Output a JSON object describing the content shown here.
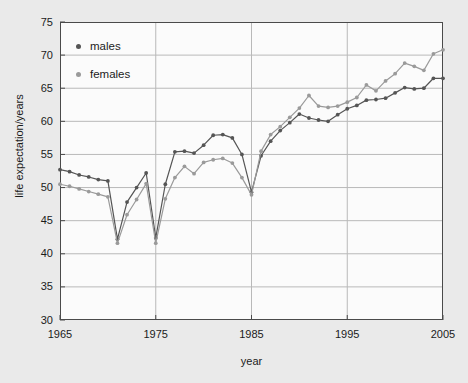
{
  "chart_data": {
    "type": "line",
    "title": "",
    "xlabel": "year",
    "ylabel": "life expectation/years",
    "xlim": [
      1965,
      2005
    ],
    "ylim": [
      30,
      75
    ],
    "xticks": [
      1965,
      1975,
      1985,
      1995,
      2005
    ],
    "yticks": [
      30,
      35,
      40,
      45,
      50,
      55,
      60,
      65,
      70,
      75
    ],
    "grid": true,
    "legend_position": "upper-left-inside",
    "x": [
      1965,
      1966,
      1967,
      1968,
      1969,
      1970,
      1971,
      1972,
      1973,
      1974,
      1975,
      1976,
      1977,
      1978,
      1979,
      1980,
      1981,
      1982,
      1983,
      1984,
      1985,
      1986,
      1987,
      1988,
      1989,
      1990,
      1991,
      1992,
      1993,
      1994,
      1995,
      1996,
      1997,
      1998,
      1999,
      2000,
      2001,
      2002,
      2003,
      2004,
      2005
    ],
    "series": [
      {
        "name": "males",
        "color": "#555555",
        "values": [
          52.7,
          52.4,
          51.9,
          51.6,
          51.2,
          51.0,
          42.2,
          47.8,
          50.0,
          52.2,
          42.4,
          50.5,
          55.4,
          55.5,
          55.2,
          56.4,
          57.9,
          58.0,
          57.5,
          55.0,
          49.3,
          54.8,
          57.0,
          58.6,
          59.8,
          61.1,
          60.5,
          60.2,
          60.0,
          61.0,
          61.9,
          62.4,
          63.2,
          63.3,
          63.5,
          64.3,
          65.1,
          64.9,
          65.0,
          66.5,
          66.5
        ]
      },
      {
        "name": "females",
        "color": "#9a9a9a",
        "values": [
          50.5,
          50.2,
          49.8,
          49.4,
          49.0,
          48.6,
          41.6,
          45.9,
          48.2,
          50.6,
          41.6,
          48.3,
          51.5,
          53.2,
          52.1,
          53.8,
          54.2,
          54.4,
          53.7,
          51.5,
          48.9,
          55.5,
          58.0,
          59.2,
          60.6,
          62.0,
          63.9,
          62.3,
          62.1,
          62.3,
          62.9,
          63.6,
          65.5,
          64.6,
          66.1,
          67.2,
          68.8,
          68.3,
          67.7,
          70.2,
          70.8
        ]
      }
    ],
    "legend": [
      {
        "label": "males",
        "color": "#555555"
      },
      {
        "label": "females",
        "color": "#9a9a9a"
      }
    ]
  },
  "axes": {
    "y_tick_labels": [
      "75",
      "70",
      "65",
      "60",
      "55",
      "50",
      "45",
      "40",
      "35",
      "30"
    ],
    "x_tick_labels": [
      "1965",
      "1975",
      "1985",
      "1995",
      "2005"
    ],
    "x_axis_title": "year",
    "y_axis_title": "life expectation/years"
  },
  "style": {
    "background": "#eaeaea",
    "plot_background": "#fbfbfb",
    "frame_color": "#4a4a4a",
    "grid_color": "#b9b9b9"
  }
}
